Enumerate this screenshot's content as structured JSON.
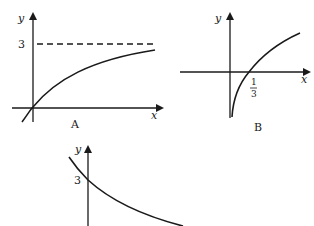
{
  "graphs": [
    {
      "id": "A",
      "caption": "A",
      "x_axis_label": "x",
      "y_axis_label": "y",
      "asymptote_value": "3",
      "description": "Increasing concave curve through origin approaching horizontal asymptote y = 3 (dashed)"
    },
    {
      "id": "B",
      "caption": "B",
      "x_axis_label": "x",
      "y_axis_label": "y",
      "x_intercept_num": "1",
      "x_intercept_den": "3",
      "description": "Logarithmic-type curve with vertical asymptote at y-axis, crossing x-axis at 1/3"
    },
    {
      "id": "C",
      "caption": "",
      "y_axis_label": "y",
      "y_intercept": "3",
      "description": "Decreasing convex curve crossing y-axis at 3"
    }
  ],
  "colors": {
    "stroke": "#1a1a1a",
    "background": "#ffffff"
  }
}
